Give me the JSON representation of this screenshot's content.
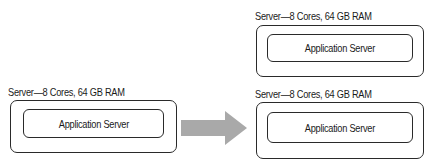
{
  "diagram": {
    "source": {
      "server_label": "Server—8 Cores, 64 GB RAM",
      "app_label": "Application Server"
    },
    "targets": [
      {
        "server_label": "Server—8 Cores, 64 GB RAM",
        "app_label": "Application Server"
      },
      {
        "server_label": "Server—8 Cores, 64 GB RAM",
        "app_label": "Application Server"
      }
    ],
    "arrow": {
      "icon": "right-arrow-icon",
      "color": "#aaaaaa"
    }
  }
}
